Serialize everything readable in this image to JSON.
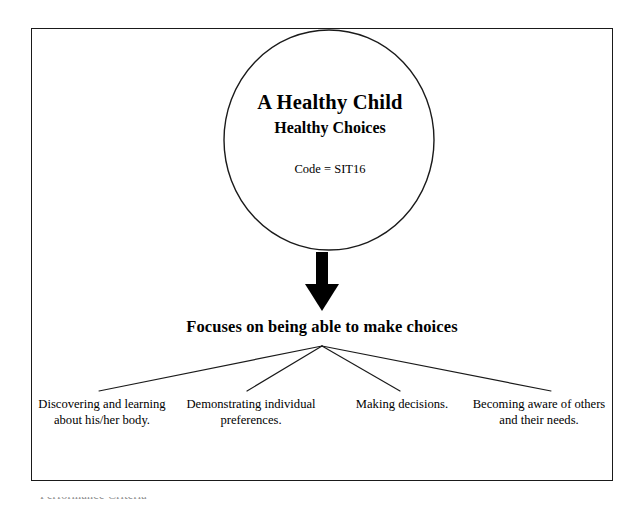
{
  "page": {
    "background_color": "#ffffff",
    "line_color": "#1a1a1a"
  },
  "diagram": {
    "type": "flow-tree",
    "root_node": {
      "shape": "ellipse",
      "title": "A Healthy Child",
      "subtitle": "Healthy Choices",
      "code_label": "Code = SIT16"
    },
    "connector": {
      "arrow": "down-arrow",
      "direction": "down"
    },
    "focus_heading": "Focuses on being able to make choices",
    "branches": [
      {
        "label": "Discovering and learning about his/her body."
      },
      {
        "label": "Demonstrating individual preferences."
      },
      {
        "label": "Making decisions."
      },
      {
        "label": "Becoming aware of others and their needs."
      }
    ]
  },
  "footer": {
    "cutoff_caption": "Performance Criteria"
  }
}
